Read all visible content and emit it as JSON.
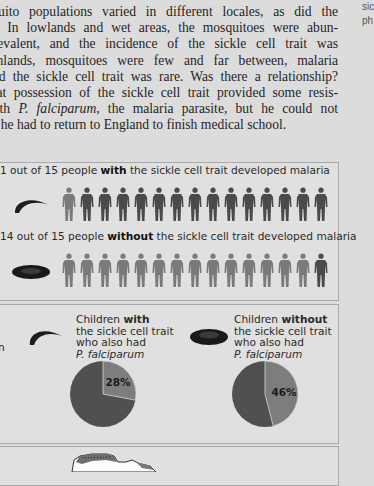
{
  "body_text": {
    "lines": [
      "squito populations varied in different locales, as did the",
      "ia. In lowlands and wet areas, the mosquitoes were abun-",
      " prevalent, and the incidence of the sickle cell trait was",
      "ighlands, mosquitoes were few and far between, malaria",
      " and the sickle cell trait was rare. Was there a relationship?",
      " that possession of the sickle cell trait provided some resis-",
      "with ",
      "se he had to return to England to finish medical school."
    ],
    "line7_italic": "P. falciparum",
    "line7_rest": ", the malaria parasite, but he could not"
  },
  "side_note": {
    "line1": "sic",
    "line2": "ph"
  },
  "panel_people": {
    "row_with": {
      "caption_pre": "1 out of 15 people ",
      "caption_bold": "with",
      "caption_post": " the sickle cell trait developed malaria",
      "cell_icon": "sickle-cell-icon",
      "total": 15,
      "developed": 1
    },
    "row_without": {
      "caption_pre": "14 out of 15 people ",
      "caption_bold": "without",
      "caption_post": " the sickle cell trait developed malaria",
      "cell_icon": "normal-red-cell-icon",
      "total": 15,
      "developed": 14
    },
    "colors": {
      "developed": "#7a7a7a",
      "not_developed": "#4a4a4a"
    }
  },
  "panel_pies": {
    "left_cut_text": "n",
    "with": {
      "label_line1_pre": "Children ",
      "label_line1_bold": "with",
      "label_line2": "the sickle cell trait",
      "label_line3": "who also had",
      "label_line4": "P. falciparum",
      "percent": 28,
      "percent_label": "28%"
    },
    "without": {
      "label_line1_pre": "Children ",
      "label_line1_bold": "without",
      "label_line2": "the sickle cell trait",
      "label_line3": "who also had",
      "label_line4": "P. falciparum",
      "percent": 46,
      "percent_label": "46%"
    },
    "colors": {
      "slice": "#7d7d7d",
      "rest": "#505050"
    }
  },
  "chart_data": [
    {
      "type": "pie",
      "title": "Children with the sickle cell trait who also had P. falciparum",
      "categories": [
        "Had P. falciparum",
        "Did not"
      ],
      "values": [
        28,
        72
      ],
      "annotations": [
        "28%"
      ]
    },
    {
      "type": "pie",
      "title": "Children without the sickle cell trait who also had P. falciparum",
      "categories": [
        "Had P. falciparum",
        "Did not"
      ],
      "values": [
        46,
        54
      ],
      "annotations": [
        "46%"
      ]
    },
    {
      "type": "table",
      "title": "People who developed malaria",
      "categories": [
        "with sickle cell trait",
        "without sickle cell trait"
      ],
      "series": [
        {
          "name": "developed malaria",
          "values": [
            1,
            14
          ]
        },
        {
          "name": "total",
          "values": [
            15,
            15
          ]
        }
      ]
    }
  ]
}
